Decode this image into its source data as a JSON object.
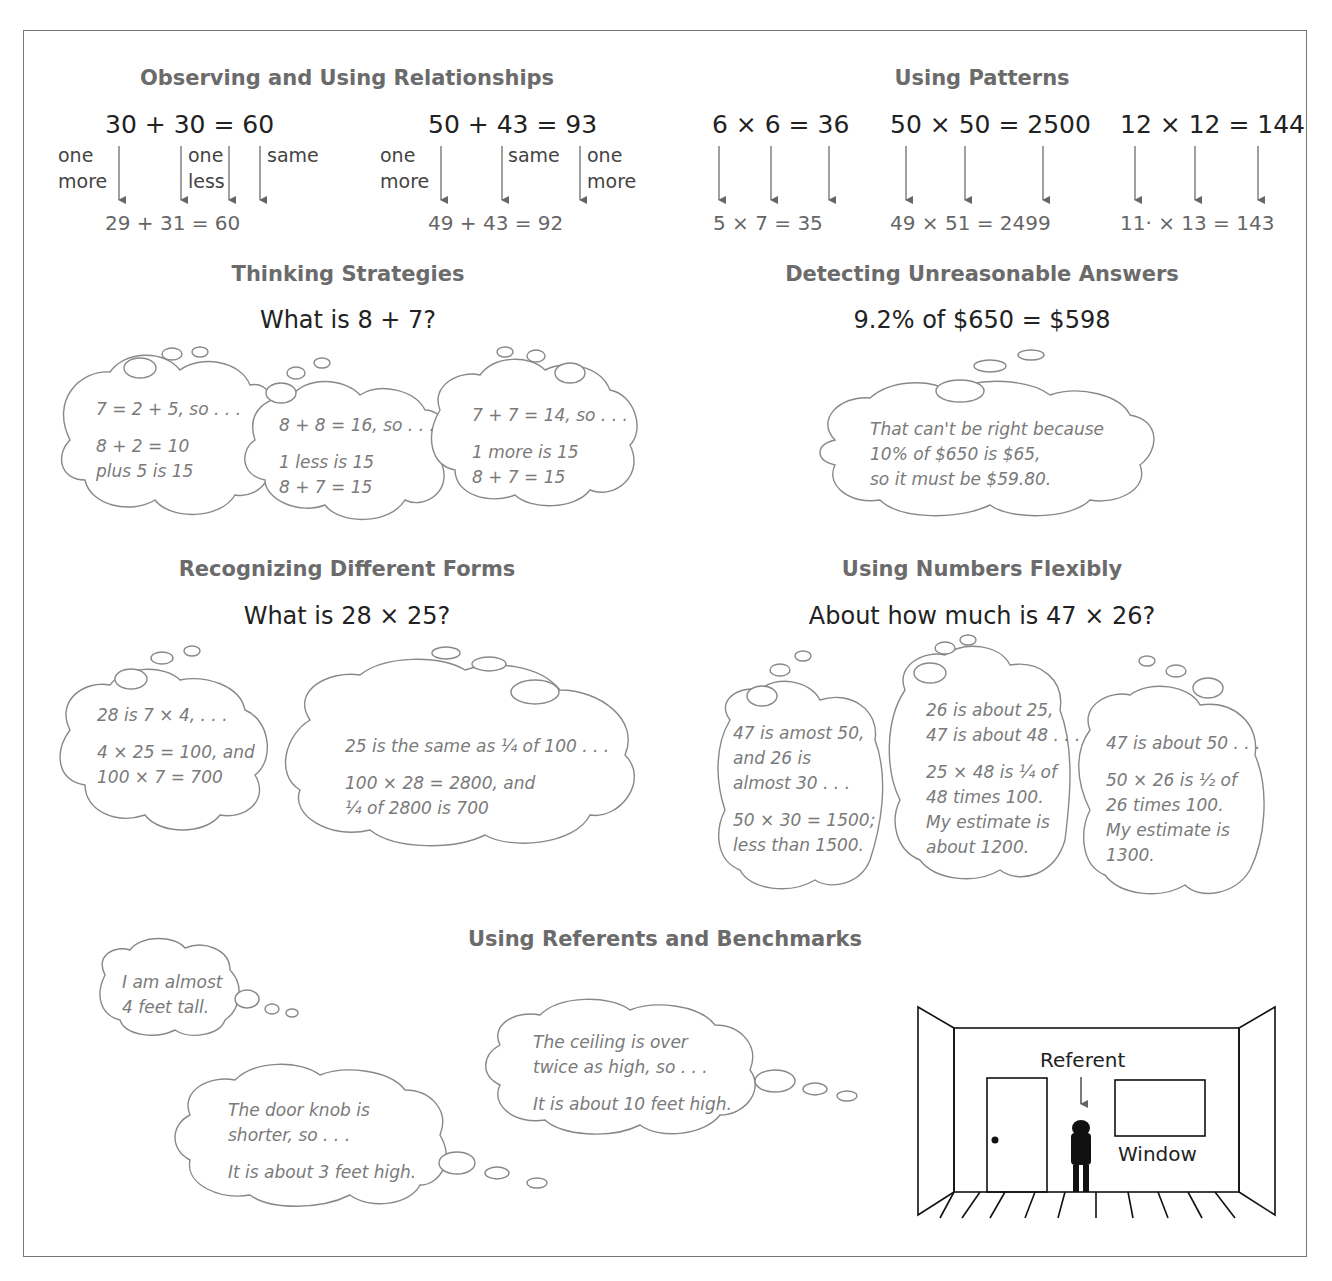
{
  "sections": {
    "relationships": {
      "heading": "Observing and Using Relationships",
      "examples": [
        {
          "top": "30 + 30  =  60",
          "bottom": "29  +  31   =   60",
          "labels": [
            "one\nmore",
            "one\nless",
            "same"
          ]
        },
        {
          "top": "50 + 43  =  93",
          "bottom": "49  +  43   =   92",
          "labels": [
            "one\nmore",
            "same",
            "one\nmore"
          ]
        }
      ]
    },
    "patterns": {
      "heading": "Using Patterns",
      "examples": [
        {
          "top": "6 × 6 = 36",
          "bottom": "5  ×  7  =  35"
        },
        {
          "top": "50 × 50 = 2500",
          "bottom": "49  ×  51  =  2499"
        },
        {
          "top": "12 × 12 = 144",
          "bottom": "11·  ×  13  =  143"
        }
      ]
    },
    "thinking": {
      "heading": "Thinking Strategies",
      "question": "What is 8 + 7?",
      "thoughts": [
        {
          "lines": [
            "7 = 2 + 5, so . . .",
            "",
            "8 + 2 = 10",
            "plus 5 is 15"
          ]
        },
        {
          "lines": [
            "8 + 8 = 16, so . . .",
            "",
            "1 less is 15",
            "8 + 7 = 15"
          ]
        },
        {
          "lines": [
            "7 + 7 = 14, so . . .",
            "",
            "1 more is 15",
            "8 + 7 = 15"
          ]
        }
      ]
    },
    "unreasonable": {
      "heading": "Detecting Unreasonable Answers",
      "question": "9.2% of $650 = $598",
      "thoughts": [
        {
          "lines": [
            "That can't be right because",
            "10% of $650 is $65,",
            "so it must be $59.80."
          ]
        }
      ]
    },
    "forms": {
      "heading": "Recognizing Different Forms",
      "question": "What is 28 × 25?",
      "thoughts": [
        {
          "lines": [
            "28 is 7 × 4, . . .",
            "",
            "4 × 25 = 100, and",
            "100 × 7 = 700"
          ]
        },
        {
          "lines": [
            "25 is the same as ¼ of 100 . . .",
            "",
            "100 × 28 = 2800, and",
            "¼ of 2800 is 700"
          ]
        }
      ]
    },
    "flexibly": {
      "heading": "Using Numbers Flexibly",
      "question": "About how much is 47 × 26?",
      "thoughts": [
        {
          "lines": [
            "47 is amost 50,",
            "and 26 is",
            "almost 30 . . .",
            "",
            "50 × 30 = 1500;",
            "less than 1500."
          ]
        },
        {
          "lines": [
            "26 is about 25,",
            "47 is about 48 . . .",
            "",
            "25 × 48 is ¼ of",
            "48 times 100.",
            "My estimate is",
            "about 1200."
          ]
        },
        {
          "lines": [
            "47 is about 50 . . .",
            "",
            "50 × 26 is ½ of",
            "26 times 100.",
            "My estimate is",
            "1300."
          ]
        }
      ]
    },
    "referents": {
      "heading": "Using Referents and Benchmarks",
      "thoughts": [
        {
          "lines": [
            "I am almost",
            "4 feet tall."
          ]
        },
        {
          "lines": [
            "The door knob is",
            "shorter, so . . .",
            "",
            "It is about 3 feet high."
          ]
        },
        {
          "lines": [
            "The ceiling is over",
            "twice as high, so . . .",
            "",
            "It is about 10 feet high."
          ]
        }
      ],
      "room": {
        "referent_label": "Referent",
        "window_label": "Window"
      }
    }
  }
}
